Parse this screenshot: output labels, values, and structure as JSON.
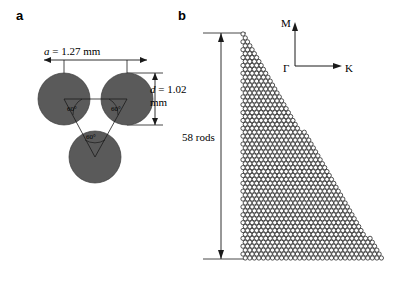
{
  "figure": {
    "width": 395,
    "height": 286,
    "background": "#ffffff"
  },
  "panels": {
    "a": {
      "label": "a",
      "description": "triangular-lattice-unit-cell",
      "rod_fill": "#5a5a5a",
      "rod_stroke": "#3c3c3c",
      "lattice_constant_label": "a = 1.27 mm",
      "rod_diameter_label": "d = 1.02 mm",
      "angle_labels": [
        "60°",
        "60°",
        "60°"
      ],
      "rods": [
        {
          "cx": 64,
          "cy": 99,
          "r": 26
        },
        {
          "cx": 127,
          "cy": 99,
          "r": 26
        },
        {
          "cx": 95,
          "cy": 157,
          "r": 26
        }
      ]
    },
    "b": {
      "label": "b",
      "description": "triangular-photonic-crystal-lattice",
      "rod_fill": "#ffffff",
      "rod_stroke": "#1a1a1a",
      "size_label": "58 rods",
      "axes": {
        "origin_label": "Γ",
        "vertical_label": "M",
        "horizontal_label": "K"
      }
    }
  },
  "colors": {
    "line": "#1a1a1a",
    "rod_dark": "#5a5a5a",
    "rod_light": "#ffffff",
    "text": "#000000"
  }
}
